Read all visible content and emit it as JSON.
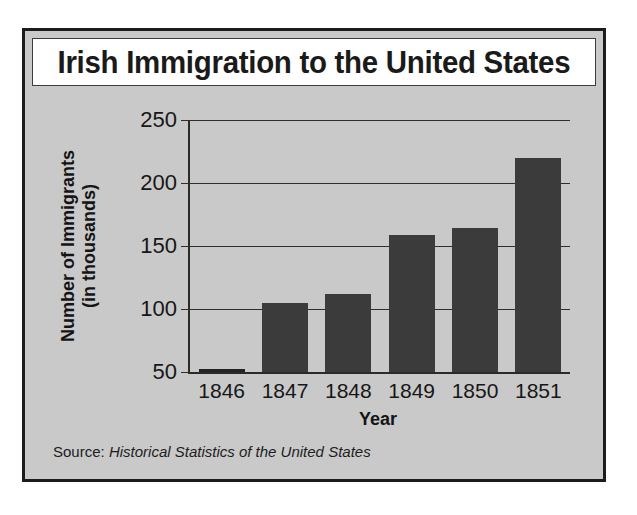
{
  "figure": {
    "title": "Irish Immigration to the United States",
    "source_prefix": "Source:",
    "source_title": "Historical Statistics of the United States"
  },
  "colors": {
    "bar": "#3b3b3b",
    "plot_background": "#c9c9c9",
    "frame": "#1c1c1c",
    "title_background": "#ffffff",
    "text": "#171717"
  },
  "chart_data": {
    "type": "bar",
    "title": "Irish Immigration to the United States",
    "xlabel": "Year",
    "ylabel": "Number of Immigrants (in thousands)",
    "ylabel_line1": "Number of Immigrants",
    "ylabel_line2": "(in thousands)",
    "categories": [
      "1846",
      "1847",
      "1848",
      "1849",
      "1850",
      "1851"
    ],
    "values": [
      51,
      105,
      112,
      159,
      164,
      220
    ],
    "ylim": [
      50,
      250
    ],
    "yticks": [
      250,
      200,
      150,
      100,
      50
    ],
    "ytick_labels": [
      "250",
      "200",
      "150",
      "100",
      "50"
    ],
    "grid": true,
    "legend": "none",
    "source": "Source: Historical Statistics of the United States"
  }
}
